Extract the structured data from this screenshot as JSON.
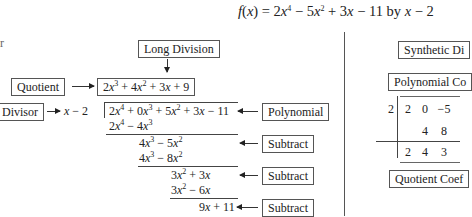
{
  "title": {
    "function_name": "f(x)",
    "expression": "f(x) = 2x⁴ − 5x² + 3x − 11 by x − 2"
  },
  "left_fragment": "r",
  "long_division": {
    "header_label": "Long Division",
    "quotient_label": "Quotient",
    "quotient": "2x³ + 4x² + 3x + 9",
    "divisor_label": "Divisor",
    "divisor": "x − 2",
    "polynomial_label": "Polynomial",
    "dividend": "2x⁴ + 0x³ + 5x² + 3x − 11",
    "steps": [
      {
        "product": "2x⁴ − 4x³",
        "remainder": "4x³ − 5x²",
        "label": "Subtract"
      },
      {
        "product": "4x³ − 8x²",
        "remainder": "3x² + 3x",
        "label": "Subtract"
      },
      {
        "product": "3x² − 6x",
        "remainder": "9x + 11",
        "label": "Subtract"
      }
    ]
  },
  "synthetic_division": {
    "header_label": "Synthetic Di",
    "coefficients_label": "Polynomial Co",
    "root": "2",
    "coefficients": [
      "2",
      "0",
      "−5"
    ],
    "products": [
      "",
      "4",
      "8"
    ],
    "results": [
      "2",
      "4",
      "3"
    ],
    "result_label": "Quotient Coef"
  }
}
